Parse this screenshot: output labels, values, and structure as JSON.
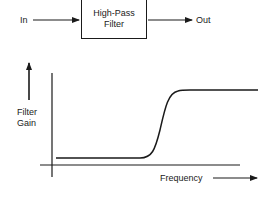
{
  "block_diagram": {
    "input_label": "In",
    "output_label": "Out",
    "block": {
      "line1": "High-Pass",
      "line2": "Filter"
    }
  },
  "graph": {
    "y_axis_label_line1": "Filter",
    "y_axis_label_line2": "Gain",
    "x_axis_label": "Frequency",
    "curve_type": "high-pass response (low gain at low frequency, sharp rise, high gain at high frequency)"
  },
  "colors": {
    "line": "#1a1a1a",
    "background": "#ffffff"
  }
}
